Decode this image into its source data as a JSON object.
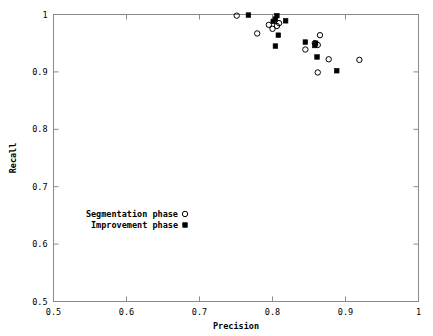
{
  "chart_data": {
    "type": "scatter",
    "title": "",
    "xlabel": "Precision",
    "ylabel": "Recall",
    "xlim": [
      0.5,
      1.0
    ],
    "ylim": [
      0.5,
      1.0
    ],
    "xticks": [
      "0.5",
      "0.6",
      "0.7",
      "0.8",
      "0.9",
      "1"
    ],
    "xtick_values": [
      0.5,
      0.6,
      0.7,
      0.8,
      0.9,
      1.0
    ],
    "yticks": [
      "0.5",
      "0.6",
      "0.7",
      "0.8",
      "0.9",
      "1"
    ],
    "ytick_values": [
      0.5,
      0.6,
      0.7,
      0.8,
      0.9,
      1.0
    ],
    "grid": false,
    "legend_position": "center-left-lower",
    "series": [
      {
        "name": "Segmentation phase",
        "marker": "open-circle",
        "color": "#000000",
        "points": [
          [
            0.751,
            0.998
          ],
          [
            0.779,
            0.967
          ],
          [
            0.795,
            0.982
          ],
          [
            0.8,
            0.975
          ],
          [
            0.806,
            0.98
          ],
          [
            0.809,
            0.985
          ],
          [
            0.845,
            0.939
          ],
          [
            0.858,
            0.95
          ],
          [
            0.862,
            0.947
          ],
          [
            0.865,
            0.964
          ],
          [
            0.862,
            0.899
          ],
          [
            0.877,
            0.922
          ],
          [
            0.919,
            0.921
          ]
        ]
      },
      {
        "name": "Improvement phase",
        "marker": "filled-square",
        "color": "#000000",
        "points": [
          [
            0.767,
            0.999
          ],
          [
            0.801,
            0.988
          ],
          [
            0.804,
            0.992
          ],
          [
            0.806,
            0.998
          ],
          [
            0.818,
            0.989
          ],
          [
            0.808,
            0.964
          ],
          [
            0.804,
            0.945
          ],
          [
            0.845,
            0.952
          ],
          [
            0.858,
            0.946
          ],
          [
            0.859,
            0.95
          ],
          [
            0.861,
            0.926
          ],
          [
            0.888,
            0.902
          ]
        ]
      }
    ]
  }
}
